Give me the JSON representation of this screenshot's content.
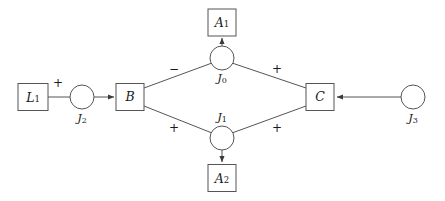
{
  "diagram": {
    "type": "signed-influence-graph",
    "background_color": "#ffffff",
    "stroke_color": "#555558",
    "text_color": "#1a1a1a",
    "nodes": [
      {
        "id": "L1",
        "shape": "box",
        "label_main": "L",
        "label_sub": "1",
        "label_text": "L1",
        "x": 33,
        "y": 97,
        "width": 30,
        "height": 27
      },
      {
        "id": "J2",
        "shape": "circle",
        "label_main": "J",
        "label_sub": "2",
        "label_text": "J2",
        "x": 82,
        "y": 97,
        "radius": 12,
        "label_position": "below"
      },
      {
        "id": "B",
        "shape": "box",
        "label_main": "B",
        "label_sub": "",
        "label_text": "B",
        "x": 130,
        "y": 97,
        "width": 28,
        "height": 27
      },
      {
        "id": "J0",
        "shape": "circle",
        "label_main": "J",
        "label_sub": "0",
        "label_text": "J0",
        "x": 222,
        "y": 58,
        "radius": 12,
        "label_position": "below"
      },
      {
        "id": "A1",
        "shape": "box",
        "label_main": "A",
        "label_sub": "1",
        "label_text": "A1",
        "x": 222,
        "y": 22,
        "width": 28,
        "height": 27
      },
      {
        "id": "J1",
        "shape": "circle",
        "label_main": "J",
        "label_sub": "1",
        "label_text": "J1",
        "x": 222,
        "y": 138,
        "radius": 12,
        "label_position": "above"
      },
      {
        "id": "A2",
        "shape": "box",
        "label_main": "A",
        "label_sub": "2",
        "label_text": "A2",
        "x": 222,
        "y": 178,
        "width": 28,
        "height": 27
      },
      {
        "id": "C",
        "shape": "box",
        "label_main": "C",
        "label_sub": "",
        "label_text": "C",
        "x": 320,
        "y": 97,
        "width": 28,
        "height": 27
      },
      {
        "id": "J3",
        "shape": "circle",
        "label_main": "J",
        "label_sub": "3",
        "label_text": "J3",
        "x": 413,
        "y": 97,
        "radius": 12,
        "label_position": "below"
      }
    ],
    "edges": [
      {
        "id": "edge-L1-J2",
        "from": "L1",
        "to": "J2",
        "arrow": false,
        "sign": "+",
        "sign_x": 58,
        "sign_y": 83
      },
      {
        "id": "edge-J2-B",
        "from": "J2",
        "to": "B",
        "arrow": true,
        "sign": "",
        "sign_x": 0,
        "sign_y": 0
      },
      {
        "id": "edge-B-J0",
        "from": "B",
        "to": "J0",
        "arrow": false,
        "sign": "−",
        "sign_x": 174,
        "sign_y": 69
      },
      {
        "id": "edge-J0-C",
        "from": "J0",
        "to": "C",
        "arrow": false,
        "sign": "+",
        "sign_x": 277,
        "sign_y": 69
      },
      {
        "id": "edge-B-J1",
        "from": "B",
        "to": "J1",
        "arrow": false,
        "sign": "+",
        "sign_x": 174,
        "sign_y": 128
      },
      {
        "id": "edge-J1-C",
        "from": "J1",
        "to": "C",
        "arrow": false,
        "sign": "+",
        "sign_x": 277,
        "sign_y": 128
      },
      {
        "id": "edge-J0-A1",
        "from": "J0",
        "to": "A1",
        "arrow": true,
        "sign": "",
        "sign_x": 0,
        "sign_y": 0
      },
      {
        "id": "edge-J1-A2",
        "from": "J1",
        "to": "A2",
        "arrow": true,
        "sign": "",
        "sign_x": 0,
        "sign_y": 0
      },
      {
        "id": "edge-J3-C",
        "from": "J3",
        "to": "C",
        "arrow": true,
        "sign": "",
        "sign_x": 0,
        "sign_y": 0
      }
    ],
    "labels": {
      "L1_main": "L",
      "L1_sub": "1",
      "J2_main": "J",
      "J2_sub": "2",
      "B_main": "B",
      "J0_main": "J",
      "J0_sub": "0",
      "A1_main": "A",
      "A1_sub": "1",
      "J1_main": "J",
      "J1_sub": "1",
      "A2_main": "A",
      "A2_sub": "2",
      "C_main": "C",
      "J3_main": "J",
      "J3_sub": "3",
      "sign_L1J2": "+",
      "sign_BJ0": "−",
      "sign_J0C": "+",
      "sign_BJ1": "+",
      "sign_J1C": "+"
    }
  }
}
